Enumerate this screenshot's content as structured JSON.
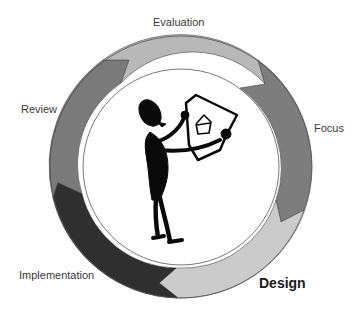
{
  "diagram": {
    "type": "cycle",
    "center": [
      181,
      167
    ],
    "outer_radius": 131,
    "inner_radius": 98,
    "active_stage": "Design",
    "stages": [
      {
        "id": "evaluation",
        "label": "Evaluation",
        "color": "#b8b8b8",
        "active": false
      },
      {
        "id": "focus",
        "label": "Focus",
        "color": "#7d7d7d",
        "active": false
      },
      {
        "id": "design",
        "label": "Design",
        "color": "#cbcbcb",
        "active": true
      },
      {
        "id": "implementation",
        "label": "Implementation",
        "color": "#2f2f2f",
        "active": false
      },
      {
        "id": "review",
        "label": "Review",
        "color": "#7a7a7a",
        "active": false
      }
    ],
    "flow_direction": "clockwise",
    "center_illustration": "stick-figure-holding-house-drawing",
    "ring_outline_color": "#555555",
    "figure_color": "#0a0a0a"
  }
}
